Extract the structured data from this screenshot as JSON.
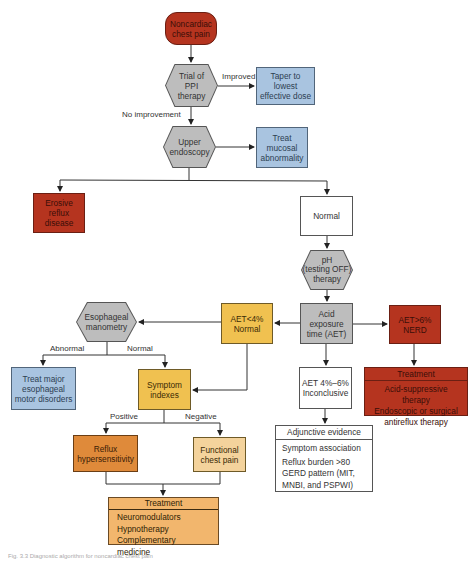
{
  "diagram": {
    "type": "flowchart",
    "nodes": {
      "start": {
        "label": "Noncardiac\nchest pain",
        "lines": [
          "Noncardiac",
          "chest pain"
        ],
        "color": "#b5341f"
      },
      "ppi_trial": {
        "lines": [
          "Trial of",
          "PPI",
          "therapy"
        ],
        "color": "#bdbdbd"
      },
      "taper": {
        "lines": [
          "Taper to",
          "lowest",
          "effective dose"
        ],
        "color": "#a9c4e0"
      },
      "endoscopy": {
        "lines": [
          "Upper",
          "endoscopy"
        ],
        "color": "#bdbdbd"
      },
      "treat_mucosal": {
        "lines": [
          "Treat",
          "mucosal",
          "abnormality"
        ],
        "color": "#a9c4e0"
      },
      "erosive": {
        "lines": [
          "Erosive",
          "reflux",
          "disease"
        ],
        "color": "#b5341f"
      },
      "normal": {
        "lines": [
          "Normal"
        ],
        "color": "#ffffff"
      },
      "ph_testing": {
        "lines": [
          "pH",
          "(testing OFF)",
          "therapy"
        ],
        "color": "#bdbdbd"
      },
      "aet": {
        "lines": [
          "Acid",
          "exposure",
          "time (AET)"
        ],
        "color": "#bdbdbd"
      },
      "aet_low": {
        "lines": [
          "AET<4%",
          "Normal"
        ],
        "color": "#f0c150"
      },
      "aet_high": {
        "lines": [
          "AET>6%",
          "NERD"
        ],
        "color": "#b5341f"
      },
      "aet_mid": {
        "lines": [
          "AET 4%–6%",
          "Inconclusive"
        ],
        "color": "#ffffff"
      },
      "manometry": {
        "lines": [
          "Esophageal",
          "manometry"
        ],
        "color": "#bdbdbd"
      },
      "treat_motor": {
        "lines": [
          "Treat major",
          "esophageal",
          "motor disorders"
        ],
        "color": "#a9c4e0"
      },
      "symptom_indexes": {
        "lines": [
          "Symptom",
          "indexes"
        ],
        "color": "#f0c150"
      },
      "reflux_hyper": {
        "lines": [
          "Reflux",
          "hypersensitivity"
        ],
        "color": "#df8a3a"
      },
      "functional": {
        "lines": [
          "Functional",
          "chest pain"
        ],
        "color": "#f4d39c"
      },
      "treatment_red": {
        "title": "Treatment",
        "items": [
          "Acid-suppressive therapy",
          "Endoscopic or surgical",
          "antireflux therapy"
        ],
        "color": "#b5341f"
      },
      "adjunctive": {
        "title": "Adjunctive evidence",
        "items": [
          "Symptom association",
          "Reflux burden >80",
          "GERD pattern (MIT,",
          "MNBI, and PSPWI)"
        ],
        "color": "#ffffff"
      },
      "treatment_orange": {
        "title": "Treatment",
        "items": [
          "Neuromodulators",
          "Hypnotherapy",
          "Complementary medicine"
        ],
        "color": "#f2b66d"
      }
    },
    "edge_labels": {
      "improved": "Improved",
      "no_improvement": "No improvement",
      "abnormal": "Abnormal",
      "normal": "Normal",
      "positive": "Positive",
      "negative": "Negative"
    },
    "caption": "Fig. 3.3 Diagnostic algorithm for noncardiac chest pain"
  }
}
